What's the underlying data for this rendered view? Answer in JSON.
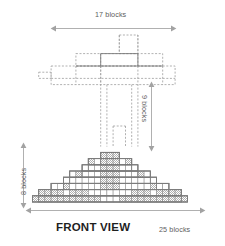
{
  "title": "FRONT VIEW",
  "dimensions": {
    "top": {
      "label": "17 blocks",
      "value": 17,
      "unit": "blocks",
      "orientation": "horizontal"
    },
    "bottom": {
      "label": "25 blocks",
      "value": 25,
      "unit": "blocks",
      "orientation": "horizontal"
    },
    "right": {
      "label": "9 blocks",
      "value": 9,
      "unit": "blocks",
      "orientation": "vertical"
    },
    "left": {
      "label": "8 blocks",
      "value": 8,
      "unit": "blocks",
      "orientation": "vertical"
    }
  },
  "style": {
    "solid_stroke": "#6e6e6e",
    "dashed_stroke": "#9a9a9a",
    "shade_fill": "#bdbdbd",
    "arrow_stroke": "#9b9b9b",
    "text_color": "#5d5d5d",
    "title_color": "#1f1f1f",
    "background": "#ffffff"
  },
  "drawing": {
    "type": "orthographic-front-view",
    "description": "Stepped pyramid of unit blocks with dashed hidden-line upper cross structure",
    "grid": {
      "cell": 6.2,
      "origin_x": 32.5,
      "baseline_y": 202.0
    },
    "base_width_blocks": 25,
    "base_height_blocks": 8,
    "upper_width_blocks": 17,
    "upper_height_blocks": 9,
    "pyramid_rows": [
      {
        "row": 0,
        "y_blocks": 0,
        "left_block": 0,
        "right_block": 25
      },
      {
        "row": 1,
        "y_blocks": 1,
        "left_block": 1,
        "right_block": 24
      },
      {
        "row": 2,
        "y_blocks": 2,
        "left_block": 3,
        "right_block": 22
      },
      {
        "row": 3,
        "y_blocks": 3,
        "left_block": 5,
        "right_block": 20
      },
      {
        "row": 4,
        "y_blocks": 4,
        "left_block": 6,
        "right_block": 19
      },
      {
        "row": 5,
        "y_blocks": 5,
        "left_block": 8,
        "right_block": 17
      },
      {
        "row": 6,
        "y_blocks": 6,
        "left_block": 9,
        "right_block": 16
      },
      {
        "row": 7,
        "y_blocks": 7,
        "left_block": 11,
        "right_block": 14
      }
    ],
    "shaded_cells": [
      [
        0,
        0
      ],
      [
        1,
        0
      ],
      [
        2,
        0
      ],
      [
        3,
        0
      ],
      [
        4,
        0
      ],
      [
        5,
        0
      ],
      [
        6,
        0
      ],
      [
        7,
        0
      ],
      [
        8,
        0
      ],
      [
        9,
        0
      ],
      [
        10,
        0
      ],
      [
        14,
        0
      ],
      [
        15,
        0
      ],
      [
        16,
        0
      ],
      [
        17,
        0
      ],
      [
        18,
        0
      ],
      [
        19,
        0
      ],
      [
        20,
        0
      ],
      [
        21,
        0
      ],
      [
        22,
        0
      ],
      [
        23,
        0
      ],
      [
        24,
        0
      ],
      [
        1,
        1
      ],
      [
        2,
        1
      ],
      [
        3,
        1
      ],
      [
        4,
        1
      ],
      [
        6,
        1
      ],
      [
        7,
        1
      ],
      [
        8,
        1
      ],
      [
        16,
        1
      ],
      [
        17,
        1
      ],
      [
        18,
        1
      ],
      [
        20,
        1
      ],
      [
        21,
        1
      ],
      [
        22,
        1
      ],
      [
        23,
        1
      ],
      [
        5,
        2
      ],
      [
        11,
        2
      ],
      [
        12,
        2
      ],
      [
        13,
        2
      ],
      [
        19,
        2
      ],
      [
        11,
        3
      ],
      [
        12,
        3
      ],
      [
        13,
        3
      ],
      [
        7,
        4
      ],
      [
        11,
        4
      ],
      [
        12,
        4
      ],
      [
        13,
        4
      ],
      [
        17,
        4
      ],
      [
        11,
        5
      ],
      [
        12,
        5
      ],
      [
        13,
        5
      ],
      [
        9,
        6
      ],
      [
        11,
        6
      ],
      [
        12,
        6
      ],
      [
        13,
        6
      ],
      [
        15,
        6
      ],
      [
        11,
        7
      ],
      [
        12,
        7
      ],
      [
        13,
        7
      ]
    ],
    "hollow_cells": [
      [
        11,
        0
      ],
      [
        12,
        0
      ],
      [
        13,
        0
      ],
      [
        5,
        1
      ],
      [
        9,
        1
      ],
      [
        10,
        1
      ],
      [
        14,
        1
      ],
      [
        15,
        1
      ],
      [
        19,
        1
      ]
    ],
    "upper_structure": {
      "line_style": "dashed",
      "note": "hidden outline of cross/T shaped upper assembly",
      "bars": [
        {
          "name": "top-stub",
          "x_blocks": [
            14,
            17
          ],
          "y_blocks": [
            14,
            17
          ]
        },
        {
          "name": "mid-bar",
          "x_blocks": [
            7,
            21
          ],
          "y_blocks": [
            12,
            14
          ]
        },
        {
          "name": "wide-bar",
          "x_blocks": [
            3,
            23
          ],
          "y_blocks": [
            9,
            12
          ]
        },
        {
          "name": "left-tail",
          "x_blocks": [
            1,
            3
          ],
          "y_blocks": [
            10,
            11
          ]
        },
        {
          "name": "center-post",
          "x_blocks": [
            11,
            14
          ],
          "y_blocks": [
            0,
            12
          ]
        }
      ]
    }
  }
}
